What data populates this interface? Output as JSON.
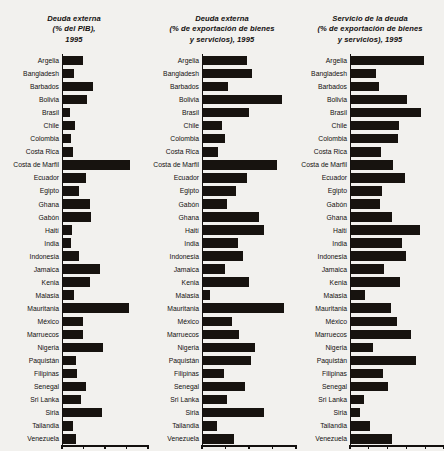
{
  "figure": {
    "background_color": "#f2f1ee",
    "bar_color": "#17130f",
    "text_color": "#13100e"
  },
  "chart_data": [
    {
      "type": "bar",
      "orientation": "horizontal",
      "title": "Deuda externa (% del PIB), 1995",
      "title_lines": [
        "Deuda externa",
        "(% del PIB),",
        "1995"
      ],
      "xlabel": "",
      "ylabel": "",
      "xlim": [
        0,
        300
      ],
      "grid": false,
      "legend": "none",
      "ticks": [
        "0",
        "75",
        "150",
        "225",
        "300"
      ],
      "tick_values": [
        0,
        75,
        150,
        225,
        300
      ],
      "categories": [
        "Argelia",
        "Bangladesh",
        "Barbados",
        "Bolivia",
        "Brasil",
        "Chile",
        "Colombia",
        "Costa Rica",
        "Costa de Marfil",
        "Ecuador",
        "Egipto",
        "Ghana",
        "Gabón",
        "Haití",
        "India",
        "Indonesia",
        "Jamaica",
        "Kenia",
        "Malasia",
        "Mauritania",
        "México",
        "Marruecos",
        "Nigeria",
        "Paquistán",
        "Filipinas",
        "Senegal",
        "Sri Lanka",
        "Siria",
        "Tailandia",
        "Venezuela"
      ],
      "values": [
        70,
        40,
        105,
        85,
        24,
        44,
        28,
        36,
        236,
        82,
        56,
        96,
        100,
        31,
        27,
        57,
        130,
        95,
        40,
        233,
        70,
        70,
        140,
        47,
        49,
        80,
        64,
        137,
        34,
        47
      ]
    },
    {
      "type": "bar",
      "orientation": "horizontal",
      "title": "Deuda externa (% de exportación de bienes y servicios), 1995",
      "title_lines": [
        "Deuda externa",
        "(% de exportación de bienes",
        "y servicios), 1995"
      ],
      "xlabel": "",
      "ylabel": "",
      "xlim": [
        0,
        500
      ],
      "grid": false,
      "legend": "none",
      "ticks": [
        "0",
        "125",
        "250",
        "375",
        "500"
      ],
      "tick_values": [
        0,
        125,
        250,
        375,
        500
      ],
      "categories": [
        "Argelia",
        "Bangladesh",
        "Barbados",
        "Bolivia",
        "Brasil",
        "Chile",
        "Colombia",
        "Costa Rica",
        "Costa de Marfil",
        "Ecuador",
        "Egipto",
        "Gabón",
        "Ghana",
        "Haití",
        "India",
        "Indonesia",
        "Jamaica",
        "Kenia",
        "Malasia",
        "Mauritania",
        "México",
        "Marruecos",
        "Nigeria",
        "Paquistán",
        "Filipinas",
        "Senegal",
        "Sri Lanka",
        "Siria",
        "Tailandia",
        "Venezuela"
      ],
      "values": [
        235,
        265,
        135,
        425,
        245,
        100,
        120,
        80,
        400,
        235,
        180,
        130,
        300,
        330,
        190,
        215,
        120,
        245,
        40,
        437,
        155,
        195,
        280,
        260,
        115,
        225,
        130,
        330,
        75,
        165
      ]
    },
    {
      "type": "bar",
      "orientation": "horizontal",
      "title": "Servicio de la deuda (% de exportación de bienes y servicios), 1995",
      "title_lines": [
        "Servicio de la deuda",
        "(% de exportación de bienes",
        "y servicios), 1995"
      ],
      "xlabel": "",
      "ylabel": "",
      "xlim": [
        0,
        50
      ],
      "grid": false,
      "legend": "none",
      "ticks": [
        "0",
        "10",
        "20",
        "30",
        "40",
        "50"
      ],
      "tick_values": [
        0,
        10,
        20,
        30,
        40,
        50
      ],
      "categories": [
        "Argelia",
        "Bangladesh",
        "Barbados",
        "Bolivia",
        "Brasil",
        "Chile",
        "Colombia",
        "Costa Rica",
        "Costa de Marfil",
        "Ecuador",
        "Egipto",
        "Gabón",
        "Ghana",
        "Haití",
        "India",
        "Indonesia",
        "Jamaica",
        "Kenia",
        "Malasia",
        "Mauritania",
        "México",
        "Marruecos",
        "Nigeria",
        "Paquistán",
        "Filipinas",
        "Senegal",
        "Sri Lanka",
        "Siria",
        "Tailandia",
        "Venezuela"
      ],
      "values": [
        39.5,
        13.5,
        15.0,
        30.0,
        37.5,
        26.0,
        25.5,
        16.0,
        22.5,
        29.0,
        16.5,
        15.5,
        22.0,
        37.0,
        27.5,
        29.5,
        18.0,
        26.5,
        7.5,
        21.5,
        24.5,
        32.0,
        12.0,
        35.0,
        17.0,
        20.0,
        7.0,
        5.0,
        10.0,
        22.0
      ]
    }
  ]
}
